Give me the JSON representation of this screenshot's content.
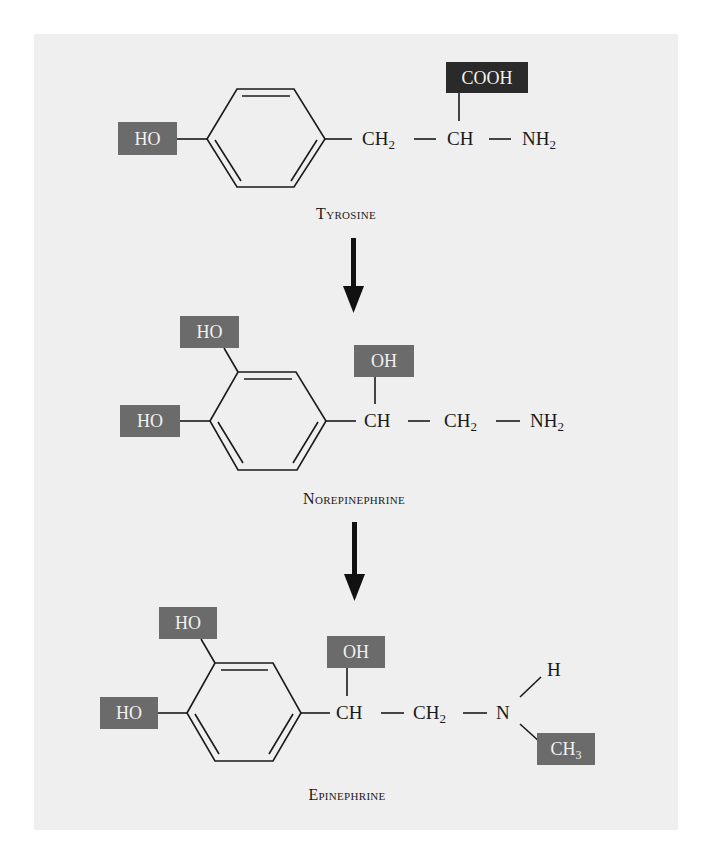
{
  "figure": {
    "colors": {
      "background": "#efefef",
      "page": "#ffffff",
      "highlight_box": "#6b6b6b",
      "dark_box": "#2a2a2a",
      "lines": "#1a1a1a"
    }
  },
  "molecules": [
    {
      "name": "Tyrosine",
      "groups": {
        "ring_substituent": "HO",
        "chain_1": "CH",
        "chain_1_sub": "2",
        "chain_2": "CH",
        "amine": "NH",
        "amine_sub": "2",
        "top_group": "COOH"
      }
    },
    {
      "name": "Norepinephrine",
      "groups": {
        "ring_substituent_top": "HO",
        "ring_substituent_left": "HO",
        "hydroxyl": "OH",
        "chain_1": "CH",
        "chain_2": "CH",
        "chain_2_sub": "2",
        "amine": "NH",
        "amine_sub": "2"
      }
    },
    {
      "name": "Epinephrine",
      "groups": {
        "ring_substituent_top": "HO",
        "ring_substituent_left": "HO",
        "hydroxyl": "OH",
        "chain_1": "CH",
        "chain_2": "CH",
        "chain_2_sub": "2",
        "nitrogen": "N",
        "hydrogen": "H",
        "methyl": "CH",
        "methyl_sub": "3"
      }
    }
  ],
  "arrows": [
    {
      "from": "Tyrosine",
      "to": "Norepinephrine"
    },
    {
      "from": "Norepinephrine",
      "to": "Epinephrine"
    }
  ]
}
